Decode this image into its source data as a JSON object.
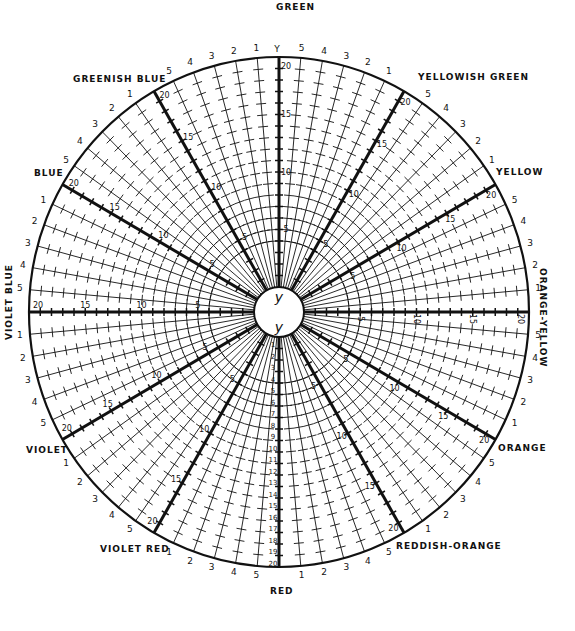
{
  "colors": {
    "ink": "#111111",
    "background": "#ffffff"
  },
  "geometry": {
    "cx": 279,
    "cy": 312,
    "rx": 250,
    "ry": 255,
    "inner_r": 25,
    "steps": 20,
    "sector_spokes": 5,
    "sector_deg": 30
  },
  "center_marks": [
    "y",
    "y"
  ],
  "top_axis_letter": "Y",
  "axes": [
    {
      "name": "GREEN",
      "angle": -90,
      "label_pos": [
        276,
        2
      ],
      "orient": "h"
    },
    {
      "name": "YELLOWISH GREEN",
      "angle": -60,
      "label_pos": [
        418,
        72
      ],
      "orient": "h"
    },
    {
      "name": "YELLOW",
      "angle": -30,
      "label_pos": [
        496,
        167
      ],
      "orient": "h"
    },
    {
      "name": "ORANGE-YELLOW",
      "angle": 0,
      "label_pos": [
        548,
        268
      ],
      "orient": "vr"
    },
    {
      "name": "ORANGE",
      "angle": 30,
      "label_pos": [
        498,
        443
      ],
      "orient": "h"
    },
    {
      "name": "REDDISH-ORANGE",
      "angle": 60,
      "label_pos": [
        396,
        541
      ],
      "orient": "h"
    },
    {
      "name": "RED",
      "angle": 90,
      "label_pos": [
        270,
        586
      ],
      "orient": "h"
    },
    {
      "name": "VIOLET RED",
      "angle": 120,
      "label_pos": [
        100,
        544
      ],
      "orient": "h"
    },
    {
      "name": "VIOLET",
      "angle": 150,
      "label_pos": [
        26,
        445
      ],
      "orient": "h"
    },
    {
      "name": "VIOLET BLUE",
      "angle": 180,
      "label_pos": [
        4,
        340
      ],
      "orient": "vl"
    },
    {
      "name": "BLUE",
      "angle": -150,
      "label_pos": [
        34,
        168
      ],
      "orient": "h"
    },
    {
      "name": "GREENISH BLUE",
      "angle": -120,
      "label_pos": [
        73,
        74
      ],
      "orient": "h"
    }
  ],
  "axis_scale_labels": [
    "5",
    "10",
    "15",
    "20"
  ],
  "red_axis_scale_labels": [
    "1",
    "2",
    "3",
    "4",
    "5",
    "6",
    "7",
    "8",
    "9",
    "10",
    "11",
    "12",
    "13",
    "14",
    "15",
    "16",
    "17",
    "18",
    "19",
    "20"
  ],
  "sector_numbers": [
    "5",
    "4",
    "3",
    "2",
    "1"
  ]
}
